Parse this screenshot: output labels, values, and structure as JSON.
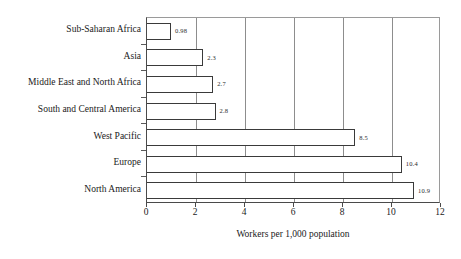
{
  "chart_data": {
    "type": "bar",
    "orientation": "horizontal",
    "title": "",
    "xlabel": "Workers per 1,000 population",
    "ylabel": "",
    "xlim": [
      0,
      12
    ],
    "xticks": [
      0,
      2,
      4,
      6,
      8,
      10,
      12
    ],
    "xtick_labels": [
      "0",
      "2",
      "4",
      "6",
      "8",
      "10",
      "12"
    ],
    "grid": true,
    "grid_axis": "x",
    "legend": false,
    "categories": [
      "Sub-Saharan Africa",
      "Asia",
      "Middle East and North Africa",
      "South and Central America",
      "West Pacific",
      "Europe",
      "North America"
    ],
    "values": [
      0.98,
      2.3,
      2.7,
      2.8,
      8.5,
      10.4,
      10.9
    ],
    "value_labels": [
      "0.98",
      "2.3",
      "2.7",
      "2.8",
      "8.5",
      "10.4",
      "10.9"
    ],
    "bar_fill_color": "#ffffff",
    "bar_edge_color": "#3a3a3a",
    "axis_color": "#4a4a4a",
    "gridline_color": "#8d8d8d",
    "background_color": "#ffffff"
  }
}
